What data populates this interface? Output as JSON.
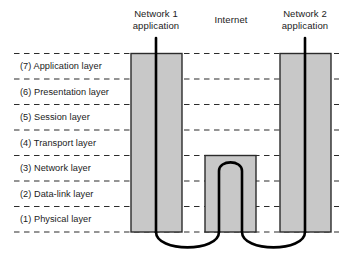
{
  "diagram": {
    "colors": {
      "box_fill": "#c8c8c8",
      "box_stroke": "#2b2b2b",
      "dashed_line": "#2b2b2b",
      "cable": "#000000",
      "text": "#1b1b1b",
      "background": "#ffffff"
    },
    "columns": [
      {
        "id": "network1",
        "header": "Network 1\napplication"
      },
      {
        "id": "internet",
        "header": "Internet"
      },
      {
        "id": "network2",
        "header": "Network 2\napplication"
      }
    ],
    "layers": [
      {
        "number": "(7)",
        "name": "Application layer",
        "label": "(7) Application layer"
      },
      {
        "number": "(6)",
        "name": "Presentation layer",
        "label": "(6) Presentation layer"
      },
      {
        "number": "(5)",
        "name": "Session layer",
        "label": "(5) Session layer"
      },
      {
        "number": "(4)",
        "name": "Transport layer",
        "label": "(4) Transport layer"
      },
      {
        "number": "(3)",
        "name": "Network layer",
        "label": "(3) Network layer"
      },
      {
        "number": "(2)",
        "name": "Data-link layer",
        "label": "(2) Data-link layer"
      },
      {
        "number": "(1)",
        "name": "Physical layer",
        "label": "(1) Physical layer"
      }
    ]
  }
}
